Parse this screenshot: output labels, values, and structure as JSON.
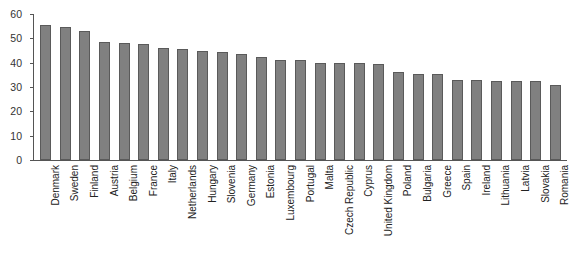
{
  "chart_data": {
    "type": "bar",
    "title": "",
    "xlabel": "",
    "ylabel": "",
    "ylim": [
      0,
      60
    ],
    "yticks": [
      0,
      10,
      20,
      30,
      40,
      50,
      60
    ],
    "grid": false,
    "legend": null,
    "bar_color": "#808080",
    "bar_edge_color": "#5a5a5a",
    "categories": [
      "Denmark",
      "Sweden",
      "Finland",
      "Austria",
      "Belgium",
      "France",
      "Italy",
      "Netherlands",
      "Hungary",
      "Slovenia",
      "Germany",
      "Estonia",
      "Luxembourg",
      "Portugal",
      "Malta",
      "Czech Republic",
      "Cyprus",
      "United Kingdom",
      "Poland",
      "Bulgaria",
      "Greece",
      "Spain",
      "Ireland",
      "Lithuania",
      "Latvia",
      "Slovakia",
      "Romania"
    ],
    "values": [
      55.5,
      54.5,
      53,
      48.5,
      48,
      47.5,
      46,
      45.5,
      45,
      44.5,
      43.5,
      42.5,
      41,
      41,
      40,
      40,
      40,
      39.5,
      36,
      35.5,
      35.5,
      33,
      33,
      32.5,
      32.5,
      32.5,
      31
    ]
  }
}
